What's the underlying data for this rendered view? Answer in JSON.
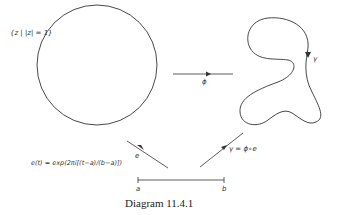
{
  "diagram": {
    "caption": "Diagram 11.4.1",
    "set_label": "{z | |z| = 1}",
    "phi_label": "ϕ",
    "gamma_label": "γ",
    "e_label": "e",
    "e_formula": "e(t) = exp(2πi[(t−a)/(b−a)])",
    "composition_label": "γ = ϕ∘e",
    "interval_left": "a",
    "interval_right": "b",
    "stroke_color": "#333333"
  }
}
